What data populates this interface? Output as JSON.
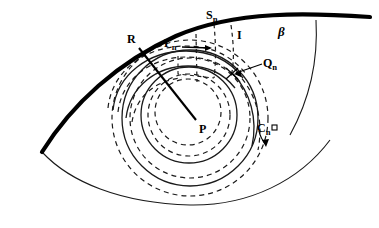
{
  "figure": {
    "width": 379,
    "height": 228,
    "background_color": "#ffffff",
    "stroke_color": "#000000"
  },
  "labels": {
    "S_n": {
      "base": "S",
      "sub": "n"
    },
    "gamma_n": {
      "base": "Γ",
      "sub": "n"
    },
    "I": {
      "base": "I",
      "sub": ""
    },
    "beta": {
      "base": "β",
      "sub": ""
    },
    "Q_n": {
      "base": "Q",
      "sub": "n"
    },
    "R": {
      "base": "R",
      "sub": ""
    },
    "P": {
      "base": "P",
      "sub": ""
    },
    "C_n": {
      "base": "C",
      "sub": "n"
    }
  },
  "elements": {
    "thick_boundary_curve": "beta boundary arc",
    "thin_lower_curve": "lower lens boundary arc",
    "thin_right_curve": "right descending arc",
    "radial_line": "R to P radius segment",
    "solid_circles": "concentric solid circles about P",
    "dashed_circles": "concentric dashed circles about P",
    "gamma_arrow": "horizontal width arrow for Gamma n",
    "qn_leader": "leader line to Q n point",
    "cn_arrow": "direction arrow on C n circle"
  },
  "colors": {
    "ink": "#000000",
    "paper": "#ffffff"
  }
}
